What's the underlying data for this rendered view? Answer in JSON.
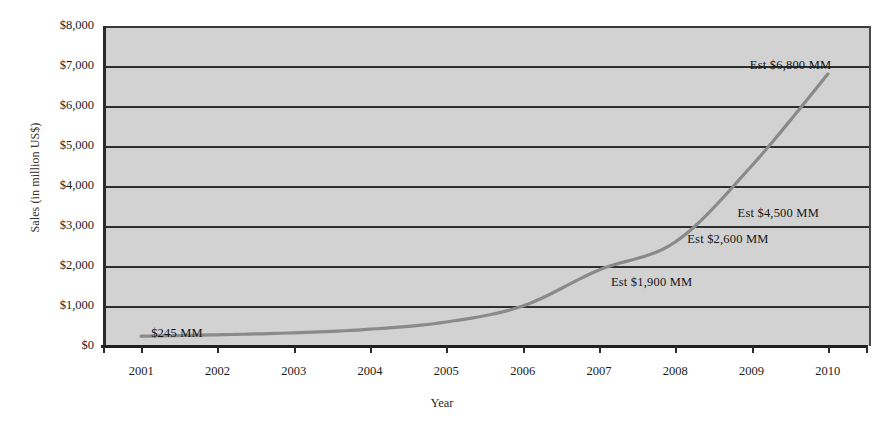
{
  "chart_data": {
    "type": "line",
    "title": "",
    "xlabel": "Year",
    "ylabel": "Sales (in million US$)",
    "categories": [
      "2001",
      "2002",
      "2003",
      "2004",
      "2005",
      "2006",
      "2007",
      "2008",
      "2009",
      "2010"
    ],
    "values": [
      245,
      280,
      330,
      420,
      600,
      1000,
      1900,
      2600,
      4500,
      6800
    ],
    "series": [
      {
        "name": "Sales",
        "values": [
          245,
          280,
          330,
          420,
          600,
          1000,
          1900,
          2600,
          4500,
          6800
        ]
      }
    ],
    "ylim": [
      0,
      8000
    ],
    "ytick_labels": [
      "$8,000",
      "$7,000",
      "$6,000",
      "$5,000",
      "$4,000",
      "$3,000",
      "$2,000",
      "$1,000",
      "$0"
    ],
    "ytick_values": [
      8000,
      7000,
      6000,
      5000,
      4000,
      3000,
      2000,
      1000,
      0
    ],
    "grid": true,
    "legend": "none",
    "line_color": "#8a8a8a",
    "plot_background": "#d2d2d2",
    "gridline_color": "#2e2e2e",
    "annotations": [
      {
        "text": "$245 MM",
        "year": "2001",
        "value": 245
      },
      {
        "text": "Est $1,900 MM",
        "year": "2007",
        "value": 1900
      },
      {
        "text": "Est $2,600 MM",
        "year": "2008",
        "value": 2600
      },
      {
        "text": "Est $4,500 MM",
        "year": "2009",
        "value": 4500
      },
      {
        "text": "Est $6,800 MM",
        "year": "2010",
        "value": 6800
      }
    ]
  }
}
